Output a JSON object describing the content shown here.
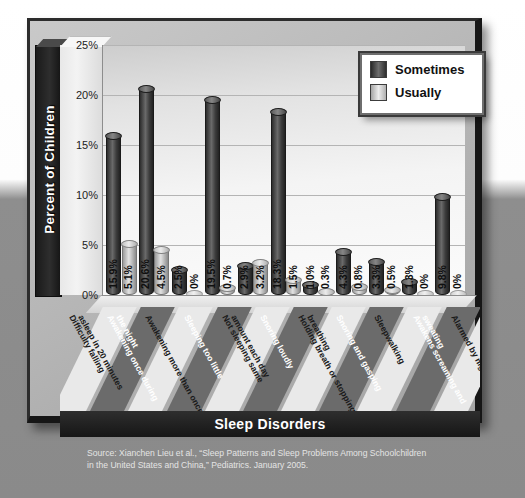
{
  "chart_data": {
    "type": "bar",
    "title": "",
    "xlabel": "Sleep Disorders",
    "ylabel": "Percent of Children",
    "ylim": [
      0,
      25
    ],
    "ytick_labels": [
      "0%",
      "5%",
      "10%",
      "15%",
      "20%",
      "25%"
    ],
    "ytick_values": [
      0,
      5,
      10,
      15,
      20,
      25
    ],
    "grid": true,
    "legend_position": "top-right",
    "categories": [
      "Difficulty falling asleep in 20 minutes",
      "Awakening once during the night",
      "Awakening more than once",
      "Sleeping too little",
      "Not sleeping same amount each day",
      "Snoring loudly",
      "Holding breath or stopping breathing",
      "Snoring and gasping",
      "Sleepwalking",
      "Awakens screaming and sweating",
      "Alarmed by nightmare"
    ],
    "category_lines": [
      [
        "Difficulty falling",
        "asleep in 20 minutes"
      ],
      [
        "Awakening once during",
        "the night"
      ],
      [
        "Awakening more than once"
      ],
      [
        "Sleeping too little"
      ],
      [
        "Not sleeping same",
        "amount each day"
      ],
      [
        "Snoring loudly"
      ],
      [
        "Holding breath or stopping",
        "breathing"
      ],
      [
        "Snoring and gasping"
      ],
      [
        "Sleepwalking"
      ],
      [
        "Awakens screaming and",
        "sweating"
      ],
      [
        "Alarmed by nightmare"
      ]
    ],
    "series": [
      {
        "name": "Sometimes",
        "color": "#3c3c3c",
        "values": [
          15.9,
          20.6,
          2.5,
          19.5,
          2.9,
          18.3,
          1.0,
          4.3,
          3.3,
          1.3,
          9.8
        ],
        "labels": [
          "15.9%",
          "20.6%",
          "2.5%",
          "19.5%",
          "2.9%",
          "18.3%",
          "1.0%",
          "4.3%",
          "3.3%",
          "1.3%",
          "9.8%"
        ]
      },
      {
        "name": "Usually",
        "color": "#c8c8c8",
        "values": [
          5.1,
          4.5,
          0,
          0.7,
          3.2,
          1.5,
          0.3,
          0.8,
          0.5,
          0,
          0
        ],
        "labels": [
          "5.1%",
          "4.5%",
          "0%",
          "0.7%",
          "3.2%",
          "1.5%",
          "0.3%",
          "0.8%",
          "0.5%",
          "0%",
          "0%"
        ]
      }
    ]
  },
  "legend": {
    "items": [
      {
        "label": "Sometimes",
        "swatch": "dark"
      },
      {
        "label": "Usually",
        "swatch": "light"
      }
    ]
  },
  "axes": {
    "y_title": "Percent of Children",
    "x_title": "Sleep Disorders"
  },
  "source": {
    "line1": "Source: Xianchen Lieu et al., “Sleep Patterns and Sleep Problems Among Schoolchildren",
    "line2": "in the United States and China,” Pediatrics. January 2005."
  }
}
